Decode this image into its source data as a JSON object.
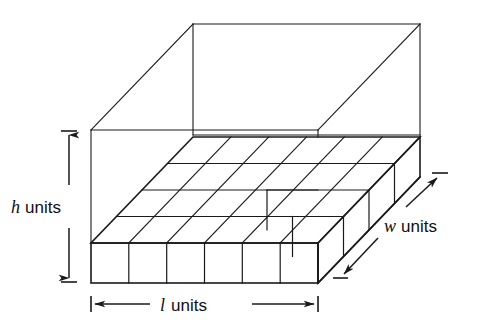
{
  "figure": {
    "background_color": "#ffffff",
    "line_color": "#1a1a1a",
    "text_color": "#101010",
    "labels": {
      "height": {
        "symbol": "h",
        "unit_text": "units",
        "full": "h units"
      },
      "length": {
        "symbol": "l",
        "unit_text": "units",
        "full": "l units"
      },
      "width": {
        "symbol": "w",
        "unit_text": "units",
        "full": "w units"
      }
    },
    "geometry": {
      "columns_along_length": 6,
      "rows_along_width": 4,
      "layers_along_height": 1,
      "top_wireframe": "open box outline above the filled unit-cube layer"
    },
    "dimension_arrows": {
      "height_arrow": "vertical double-headed arrow with serif end caps, left of prism",
      "length_arrow": "horizontal double-headed arrow with serif end caps, below prism",
      "width_arrow": "diagonal double-headed arrow with serif end caps, right of prism"
    }
  }
}
